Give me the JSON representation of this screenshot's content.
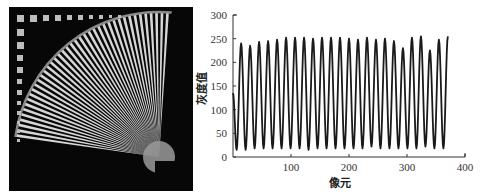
{
  "figure": {
    "left_panel": {
      "description": "Radial star (fan) resolution target image, white/black wedges in a quarter circle on black background with row of small squares along top and left edges",
      "background": "#070707",
      "stripe_color": "#e8e8e8",
      "wedge_count": 40
    }
  },
  "chart_data": {
    "type": "line",
    "title": "",
    "xlabel": "像元",
    "ylabel": "灰度值",
    "xlim": [
      0,
      400
    ],
    "ylim": [
      0,
      300
    ],
    "xticks": [
      100,
      200,
      300,
      400
    ],
    "xtick_labels": [
      "100",
      "200",
      "300",
      "400"
    ],
    "yticks": [
      0,
      50,
      100,
      150,
      200,
      250,
      300
    ],
    "ytick_labels": [
      "0",
      "50",
      "100",
      "150",
      "200",
      "250",
      "300"
    ],
    "grid": false,
    "legend": null,
    "line_color": "#1a1a1a",
    "series": [
      {
        "name": "灰度值",
        "start": {
          "x": 0,
          "y": 135
        },
        "period": 15.5,
        "first_peak_x": 14,
        "peaks": [
          240,
          235,
          243,
          245,
          248,
          252,
          252,
          252,
          250,
          252,
          252,
          252,
          250,
          248,
          252,
          248,
          250,
          245,
          230,
          252,
          255,
          225,
          248,
          255
        ],
        "troughs": [
          15,
          15,
          18,
          18,
          18,
          18,
          18,
          18,
          15,
          18,
          18,
          18,
          18,
          18,
          18,
          22,
          18,
          18,
          18,
          18,
          18,
          22,
          18,
          18
        ],
        "end_x": 375
      }
    ]
  }
}
